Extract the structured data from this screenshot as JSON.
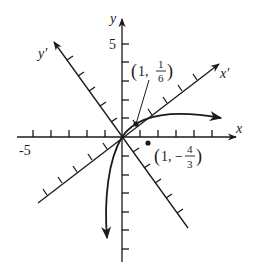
{
  "diagram": {
    "colors": {
      "ink": "#1a1a1a",
      "background": "#ffffff"
    },
    "axes": {
      "x": {
        "label": "x",
        "min_tick_label": "-5",
        "ticks": [
          -5,
          -4,
          -3,
          -2,
          -1,
          1,
          2,
          3,
          4,
          5
        ]
      },
      "y": {
        "label": "y",
        "max_tick_label": "5",
        "ticks": [
          -6,
          -5,
          -4,
          -3,
          -2,
          -1,
          1,
          2,
          3,
          4,
          5
        ]
      },
      "x_prime": {
        "label": "x′"
      },
      "y_prime": {
        "label": "y′"
      }
    },
    "points": [
      {
        "name": "point-1-one-sixth",
        "label_prefix": "(1, ",
        "num": "1",
        "den": "6",
        "label_suffix": ")"
      },
      {
        "name": "point-1-neg-four-thirds",
        "label_prefix": "(1, −",
        "num": "4",
        "den": "3",
        "label_suffix": ")"
      }
    ]
  }
}
